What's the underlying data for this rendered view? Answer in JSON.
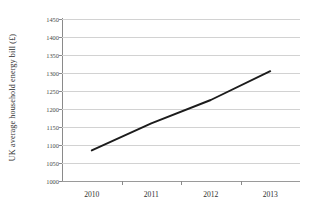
{
  "chart_data": {
    "type": "line",
    "title": "",
    "xlabel": "",
    "ylabel": "UK average household energy bill (£)",
    "categories": [
      "2010",
      "2011",
      "2012",
      "2013"
    ],
    "series": [
      {
        "name": "UK average household energy bill",
        "values": [
          1085,
          1160,
          1225,
          1305
        ]
      }
    ],
    "ylim": [
      1000,
      1450
    ],
    "ytick_labels": [
      "1450",
      "1400",
      "1350",
      "1300",
      "1250",
      "1200",
      "1150",
      "1100",
      "1050",
      "1000"
    ],
    "ytick_values": [
      1450,
      1400,
      1350,
      1300,
      1250,
      1200,
      1150,
      1100,
      1050,
      1000
    ],
    "grid": true,
    "legend": "none",
    "line_color": "#1c1c1c",
    "grid_color": "#d2d2d2",
    "axis_color": "#8a8a8a"
  }
}
